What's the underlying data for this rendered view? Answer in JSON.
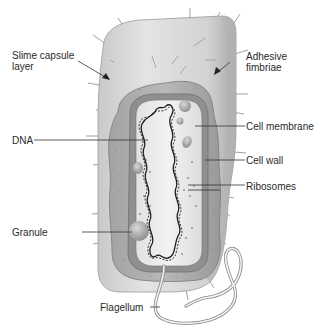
{
  "diagram": {
    "labels": {
      "slime_capsule": "Slime capsule\nlayer",
      "adhesive_fimbriae": "Adhesive\nfimbriae",
      "dna": "DNA",
      "cell_membrane": "Cell membrane",
      "cell_wall": "Cell wall",
      "ribosomes": "Ribosomes",
      "granule": "Granule",
      "flagellum": "Flagellum"
    },
    "colors": {
      "capsule": "#d9d9d9",
      "cell_wall": "#a9a9a9",
      "membrane": "#8c8c8c",
      "cytoplasm": "#ececec",
      "dna": "#1e1e1e",
      "text": "#2a2a2a",
      "leader_line": "#333333"
    }
  }
}
